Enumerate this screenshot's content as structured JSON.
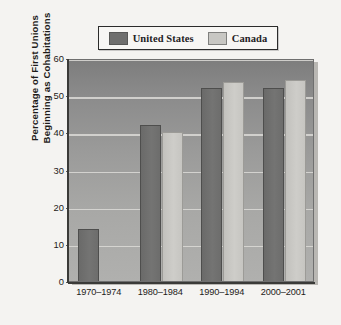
{
  "chart_data": {
    "type": "bar",
    "title": "",
    "xlabel": "",
    "ylabel": "Percentage of First Unions Beginning as Cohabitations",
    "ylabel_lines": [
      "Percentage of First Unions",
      "Beginning as Cohabitations"
    ],
    "categories": [
      "1970–1974",
      "1980–1984",
      "1990–1994",
      "2000–2001"
    ],
    "series": [
      {
        "name": "United States",
        "color": "#6f6f6e",
        "values": [
          14,
          42,
          52,
          52
        ]
      },
      {
        "name": "Canada",
        "color": "#c8c7c3",
        "values": [
          null,
          40,
          53.5,
          54
        ]
      }
    ],
    "ylim": [
      0,
      60
    ],
    "yticks": [
      0,
      10,
      20,
      30,
      40,
      50,
      60
    ],
    "ytick_labels": [
      "0",
      "10",
      "20",
      "30",
      "40",
      "50",
      "60"
    ],
    "grid": true,
    "grid_axis": "y",
    "legend_position": "top",
    "legend_entries": [
      "United States",
      "Canada"
    ]
  },
  "legend": {
    "entries": [
      {
        "label": "United States",
        "swatch_color": "#6f6f6e"
      },
      {
        "label": "Canada",
        "swatch_color": "#c8c7c3"
      }
    ]
  },
  "colors": {
    "figure_background": "#f4f3f1",
    "plot_background": "#9b9b9a",
    "gridline": "#dcdbd7",
    "axis": "#3a3a38",
    "text": "#1d1b19",
    "series_us": "#6f6f6e",
    "series_canada": "#c8c7c3"
  }
}
